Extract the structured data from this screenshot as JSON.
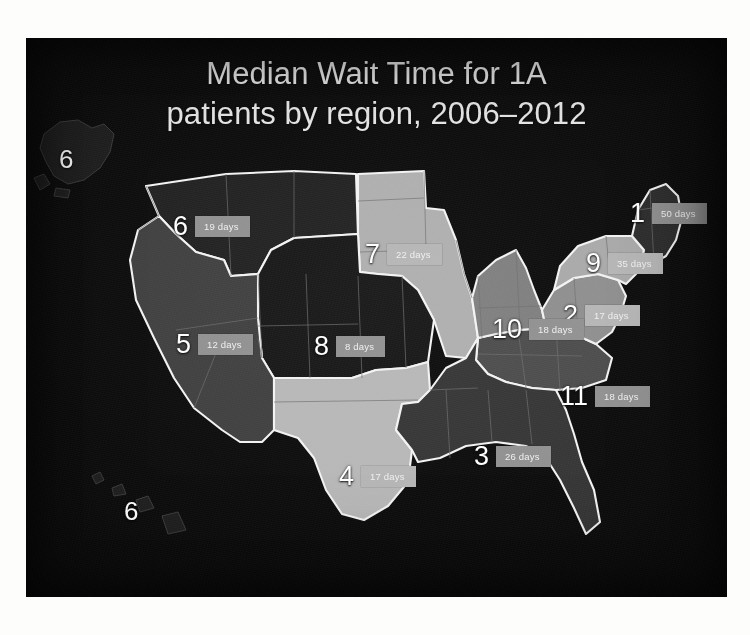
{
  "slide": {
    "background_color": "#090909",
    "title_line_1": "Median Wait Time for 1A",
    "title_line_2": "patients by region, 2006–2012",
    "title_color": "#e9e9e9"
  },
  "map": {
    "type": "choropleth",
    "geography": "United States UNOS transplant regions",
    "border_color": "#f2f2f2",
    "state_line_color": "#6d6d6d",
    "badge_color": "#9d9d9d",
    "badge_text_color": "#efefef",
    "number_color": "#ffffff"
  },
  "chart_data": {
    "type": "heatmap",
    "title": "Median Wait Time for 1A patients by region, 2006–2012",
    "xlabel": "",
    "ylabel": "",
    "unit": "days",
    "legend": "none",
    "value_label_suffix": " days",
    "categories": [
      "Region 1",
      "Region 2",
      "Region 3",
      "Region 4",
      "Region 5",
      "Region 6",
      "Region 7",
      "Region 8",
      "Region 9",
      "Region 10",
      "Region 11"
    ],
    "values": [
      50,
      17,
      26,
      17,
      12,
      19,
      22,
      8,
      35,
      18,
      18
    ],
    "value_range": [
      8,
      50
    ]
  },
  "regions": [
    {
      "id": "1",
      "number": "1",
      "days_label": "50 days",
      "value": 50,
      "fill": "#2a2a2a",
      "badge_class": "badge-dark",
      "marker_left": 604,
      "marker_top": 162
    },
    {
      "id": "9",
      "number": "9",
      "days_label": "35 days",
      "value": 35,
      "fill": "#a8a8a8",
      "badge_class": "badge-light",
      "marker_left": 560,
      "marker_top": 212
    },
    {
      "id": "2",
      "number": "2",
      "days_label": "17 days",
      "value": 17,
      "fill": "#8d8d8d",
      "badge_class": "badge-light",
      "marker_left": 537,
      "marker_top": 264
    },
    {
      "id": "10",
      "number": "10",
      "days_label": "18 days",
      "value": 18,
      "fill": "#7d7d7d",
      "badge_class": "badge-dark",
      "marker_left": 466,
      "marker_top": 278
    },
    {
      "id": "11",
      "number": "11",
      "days_label": "18 days",
      "value": 18,
      "fill": "#4a4a4a",
      "badge_class": "badge-dark",
      "marker_left": 534,
      "marker_top": 345
    },
    {
      "id": "3",
      "number": "3",
      "days_label": "26 days",
      "value": 26,
      "fill": "#333333",
      "badge_class": "badge-dark",
      "marker_left": 448,
      "marker_top": 405
    },
    {
      "id": "4",
      "number": "4",
      "days_label": "17 days",
      "value": 17,
      "fill": "#b6b6b6",
      "badge_class": "badge-light",
      "marker_left": 313,
      "marker_top": 425
    },
    {
      "id": "8",
      "number": "8",
      "days_label": "8 days",
      "value": 8,
      "fill": "#141414",
      "badge_class": "badge-dark",
      "marker_left": 288,
      "marker_top": 295
    },
    {
      "id": "7",
      "number": "7",
      "days_label": "22 days",
      "value": 22,
      "fill": "#adadad",
      "badge_class": "badge-light",
      "marker_left": 339,
      "marker_top": 203
    },
    {
      "id": "5",
      "number": "5",
      "days_label": "12 days",
      "value": 12,
      "fill": "#3d3d3d",
      "badge_class": "badge-dark",
      "marker_left": 150,
      "marker_top": 293
    },
    {
      "id": "6",
      "number": "6",
      "days_label": "19 days",
      "value": 19,
      "fill": "#1e1e1e",
      "badge_class": "badge-dark",
      "marker_left": 147,
      "marker_top": 175
    }
  ],
  "insets": [
    {
      "id": "alaska",
      "name": "alaska-inset",
      "number": "6",
      "value": 19,
      "fill": "#1c1c1c",
      "marker_left": 33,
      "marker_top": 108
    },
    {
      "id": "hawaii",
      "name": "hawaii-inset",
      "number": "6",
      "value": 19,
      "fill": "#1c1c1c",
      "marker_left": 98,
      "marker_top": 460
    }
  ]
}
